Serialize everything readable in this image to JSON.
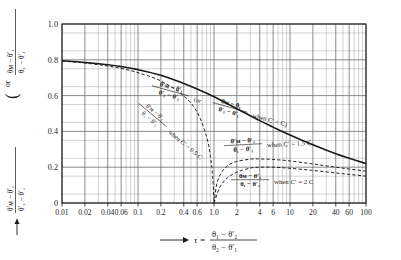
{
  "figure": {
    "name": "log-mean-temperature-correction-chart",
    "background": "#ffffff",
    "ink": "#1a1a1a"
  },
  "axes": {
    "x_title_arrow": "⟶",
    "x_title_symbol": "τ =",
    "x_title_numerator": "θ₁ − θ′₂",
    "x_title_denominator": "θ₂ − θ′₁",
    "x_ticks": [
      "0.01",
      "0.02",
      "0.04",
      "0.06",
      "0.1",
      "0.2",
      "0.4",
      "0.6",
      "1.0",
      "2",
      "4",
      "6",
      "10",
      "20",
      "40",
      "60",
      "100"
    ],
    "x_tick_values": [
      0.01,
      0.02,
      0.04,
      0.06,
      0.1,
      0.2,
      0.4,
      0.6,
      1.0,
      2,
      4,
      6,
      10,
      20,
      40,
      60,
      100
    ],
    "x_scale": "log",
    "x_min": 0.01,
    "x_max": 100,
    "y_ticks": [
      "0",
      "0.2",
      "0.4",
      "0.6",
      "0.8",
      "1.0"
    ],
    "y_tick_values": [
      0,
      0.2,
      0.4,
      0.6,
      0.8,
      1.0
    ],
    "y_min": 0,
    "y_max": 1.0,
    "y_scale": "linear",
    "y_title_arrow": "↑",
    "y_title_upper_num": "θᴍ − θ′₁",
    "y_title_upper_den": "θ₁ − θ′₁",
    "y_title_or": "or",
    "y_title_lower_num": "θ′ᴍ − θ′₁",
    "y_title_lower_den": "θ′₂ − θ′₁",
    "grid": true
  },
  "annotations": {
    "main_curve": {
      "frac1_num": "θ′ᴍ − θ′₁",
      "frac1_den": "θ′₁ − θ′₁",
      "or_text": "(or",
      "frac2_num": "θᴍ − θ₁",
      "frac2_den": "θ′₁ − θ′₁",
      "condition": "when C′ = C)"
    },
    "curve_05c": {
      "frac_num": "θ′ᴍ − θ′₁",
      "frac_den": "θ₁ − θ′₁",
      "condition": "when C′ = 0.5 C"
    },
    "curve_15c": {
      "frac_num": "θ′ᴍ − θ′₁",
      "frac_den": "θ₁ − θ′₁",
      "condition": "when C′ = 1.5 C"
    },
    "curve_2c": {
      "frac_num": "θᴍ − θ′₁",
      "frac_den": "θ₁ − θ′₁",
      "condition": "when C′ = 2 C"
    }
  },
  "chart_data": {
    "type": "line",
    "title": "",
    "subtitle": "",
    "xlabel": "τ = (θ₁ − θ′₂)/(θ₂ − θ′₁)",
    "ylabel": "(θᴍ − θ′₁)/(θ₁ − θ′₁) or (θ′ᴍ − θ′₁)/(θ′₂ − θ′₁)",
    "xlim": [
      0.01,
      100
    ],
    "ylim": [
      0,
      1.0
    ],
    "xscale": "log",
    "yscale": "linear",
    "grid": true,
    "legend_position": "inline-annotations",
    "series": [
      {
        "name": "C' = C",
        "style": "solid",
        "label": "(θ′ᴍ − θ′₁)/(θ′₁ − θ′₁) or (θᴍ − θ₁)/(θ′₁ − θ′₁) when C′ = C",
        "x": [
          0.01,
          0.02,
          0.04,
          0.06,
          0.1,
          0.2,
          0.4,
          0.6,
          1.0,
          2,
          4,
          6,
          10,
          20,
          40,
          60,
          100
        ],
        "y": [
          0.795,
          0.785,
          0.772,
          0.762,
          0.745,
          0.714,
          0.668,
          0.637,
          0.594,
          0.527,
          0.46,
          0.424,
          0.38,
          0.325,
          0.275,
          0.25,
          0.22
        ]
      },
      {
        "name": "C' = 0.5 C",
        "style": "dashed",
        "label": "(θ′ᴍ − θ′₁)/(θ₁ − θ′₁) when C′ = 0.5 C",
        "x": [
          0.01,
          0.02,
          0.04,
          0.06,
          0.1,
          0.2,
          0.4,
          0.6,
          0.8,
          0.9,
          0.96,
          1.0
        ],
        "y": [
          0.793,
          0.782,
          0.765,
          0.752,
          0.728,
          0.682,
          0.598,
          0.508,
          0.37,
          0.255,
          0.15,
          0.0
        ]
      },
      {
        "name": "C' = 1.5 C",
        "style": "dashed",
        "label": "(θ′ᴍ − θ′₁)/(θ₁ − θ′₁) when C′ = 1.5 C",
        "x": [
          1.0,
          1.1,
          1.3,
          1.6,
          2.0,
          3.0,
          4.0,
          6.0,
          10,
          20,
          40,
          60,
          100
        ],
        "y": [
          0.0,
          0.115,
          0.18,
          0.215,
          0.232,
          0.245,
          0.246,
          0.243,
          0.235,
          0.218,
          0.2,
          0.19,
          0.178
        ]
      },
      {
        "name": "C' = 2 C",
        "style": "dashed",
        "label": "(θᴍ − θ′₁)/(θ₁ − θ′₁) when C′ = 2 C",
        "x": [
          1.0,
          1.2,
          1.5,
          2.0,
          3.0,
          4.0,
          6.0,
          10,
          20,
          40,
          60,
          100
        ],
        "y": [
          0.0,
          0.09,
          0.14,
          0.172,
          0.195,
          0.2,
          0.2,
          0.194,
          0.182,
          0.168,
          0.16,
          0.15
        ]
      }
    ]
  }
}
